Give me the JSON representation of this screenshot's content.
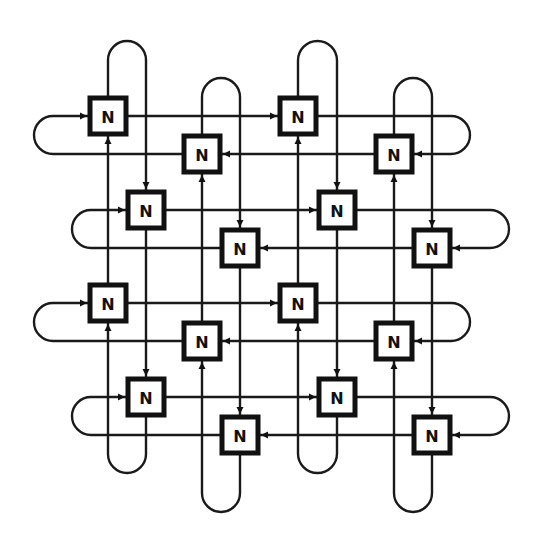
{
  "diagram": {
    "type": "toroidal-mesh network of processing nodes",
    "node_label": "N",
    "colors": {
      "line": "#1a1a1a",
      "node_border": "#111111",
      "background": "#ffffff"
    },
    "columns": [
      {
        "x": 108,
        "dir": "up"
      },
      {
        "x": 146,
        "dir": "down"
      },
      {
        "x": 202,
        "dir": "up"
      },
      {
        "x": 240,
        "dir": "down"
      },
      {
        "x": 298,
        "dir": "up"
      },
      {
        "x": 337,
        "dir": "down"
      },
      {
        "x": 394,
        "dir": "up"
      },
      {
        "x": 432,
        "dir": "down"
      }
    ],
    "rows": [
      {
        "y": 116,
        "dir": "right"
      },
      {
        "y": 154,
        "dir": "left"
      },
      {
        "y": 210,
        "dir": "right"
      },
      {
        "y": 248,
        "dir": "left"
      },
      {
        "y": 303,
        "dir": "right"
      },
      {
        "y": 341,
        "dir": "left"
      },
      {
        "y": 397,
        "dir": "right"
      },
      {
        "y": 435,
        "dir": "left"
      }
    ],
    "vertical_loops": [
      {
        "cols": [
          108,
          146
        ],
        "top": 41,
        "bottom": 473
      },
      {
        "cols": [
          202,
          240
        ],
        "top": 78,
        "bottom": 512
      },
      {
        "cols": [
          298,
          337
        ],
        "top": 41,
        "bottom": 473
      },
      {
        "cols": [
          394,
          432
        ],
        "top": 78,
        "bottom": 512
      }
    ],
    "horizontal_loops": [
      {
        "rows": [
          116,
          154
        ],
        "left": 34,
        "right": 470
      },
      {
        "rows": [
          210,
          248
        ],
        "left": 72,
        "right": 509
      },
      {
        "rows": [
          303,
          341
        ],
        "left": 34,
        "right": 470
      },
      {
        "rows": [
          397,
          435
        ],
        "left": 72,
        "right": 509
      }
    ],
    "nodes": [
      {
        "label": "N",
        "x": 108,
        "y": 116
      },
      {
        "label": "N",
        "x": 298,
        "y": 116
      },
      {
        "label": "N",
        "x": 202,
        "y": 154
      },
      {
        "label": "N",
        "x": 394,
        "y": 154
      },
      {
        "label": "N",
        "x": 146,
        "y": 210
      },
      {
        "label": "N",
        "x": 337,
        "y": 210
      },
      {
        "label": "N",
        "x": 240,
        "y": 248
      },
      {
        "label": "N",
        "x": 432,
        "y": 248
      },
      {
        "label": "N",
        "x": 108,
        "y": 303
      },
      {
        "label": "N",
        "x": 298,
        "y": 303
      },
      {
        "label": "N",
        "x": 202,
        "y": 341
      },
      {
        "label": "N",
        "x": 394,
        "y": 341
      },
      {
        "label": "N",
        "x": 146,
        "y": 397
      },
      {
        "label": "N",
        "x": 337,
        "y": 397
      },
      {
        "label": "N",
        "x": 240,
        "y": 435
      },
      {
        "label": "N",
        "x": 432,
        "y": 435
      }
    ]
  }
}
